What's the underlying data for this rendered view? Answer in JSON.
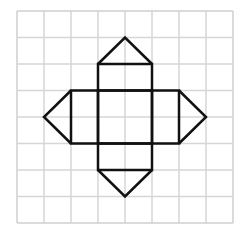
{
  "diagram": {
    "grid": {
      "cols": 8,
      "rows": 8,
      "origin_x": 17,
      "origin_y": 11,
      "cell_w": 27,
      "cell_h": 26.5,
      "line_color": "#d6d6d6",
      "border_color": "#cfcfcf"
    },
    "shape_color": "#111111",
    "shapes": {
      "center_square": {
        "col": 3,
        "row": 3,
        "w": 2,
        "h": 2
      },
      "top_square": {
        "col": 3,
        "row": 2,
        "w": 2,
        "h": 1
      },
      "bottom_square": {
        "col": 3,
        "row": 5,
        "w": 2,
        "h": 1
      },
      "left_rect": {
        "col": 2,
        "row": 3,
        "w": 1,
        "h": 2
      },
      "right_rect": {
        "col": 5,
        "row": 3,
        "w": 1,
        "h": 2
      },
      "top_triangle": [
        [
          3,
          2
        ],
        [
          4,
          1
        ],
        [
          5,
          2
        ]
      ],
      "bottom_triangle": [
        [
          3,
          6
        ],
        [
          4,
          7
        ],
        [
          5,
          6
        ]
      ],
      "left_triangle": [
        [
          2,
          3
        ],
        [
          1,
          4
        ],
        [
          2,
          5
        ]
      ],
      "right_triangle": [
        [
          6,
          3
        ],
        [
          7,
          4
        ],
        [
          6,
          5
        ]
      ]
    }
  }
}
